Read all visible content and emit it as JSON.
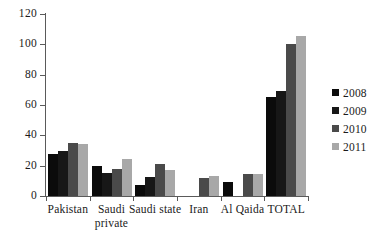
{
  "chart_data": {
    "type": "bar",
    "title": "",
    "xlabel": "",
    "ylabel": "",
    "ylim": [
      0,
      120
    ],
    "y_ticks": [
      0,
      20,
      40,
      60,
      80,
      100,
      120
    ],
    "grid": false,
    "legend_position": "right",
    "categories": [
      "Pakistan",
      "Saudi\nprivate",
      "Saudi state",
      "Iran",
      "Al Qaida",
      "TOTAL"
    ],
    "series": [
      {
        "name": "2008",
        "color": "#0b0b0b",
        "values": [
          28,
          20,
          7.5,
          0,
          9.5,
          65.5
        ]
      },
      {
        "name": "2009",
        "color": "#171717",
        "values": [
          30,
          15,
          12.5,
          0,
          0,
          69
        ]
      },
      {
        "name": "2010",
        "color": "#4a4a4a",
        "values": [
          35,
          17.5,
          21,
          12,
          14.5,
          100
        ]
      },
      {
        "name": "2011",
        "color": "#a8a8a8",
        "values": [
          34.5,
          24.5,
          17,
          13.5,
          14.5,
          105.5
        ]
      }
    ]
  }
}
